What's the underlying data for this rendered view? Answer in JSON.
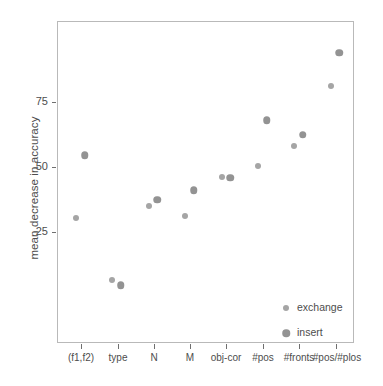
{
  "chart_data": {
    "type": "scatter",
    "title": "",
    "xlabel": "",
    "ylabel": "mean decrease in accuracy",
    "categories": [
      "(f1,f2)",
      "type",
      "N",
      "M",
      "obj-cor",
      "#pos",
      "#fronts",
      "#pos/#plos"
    ],
    "yticks": [
      25,
      50,
      75
    ],
    "ylim": [
      0,
      100
    ],
    "grid": false,
    "legend_position": "bottom-right",
    "series": [
      {
        "name": "exchange",
        "color": "#a5a5a5",
        "marker_size": "small",
        "values": [
          30.3,
          6.5,
          35.0,
          31.0,
          46.0,
          50.5,
          58.0,
          81.0
        ]
      },
      {
        "name": "insert",
        "color": "#939393",
        "marker_size": "large",
        "values": [
          54.5,
          4.5,
          37.5,
          41.0,
          45.8,
          68.0,
          62.5,
          94.0
        ]
      }
    ]
  },
  "axes": {
    "y_tick_labels": [
      "75",
      "50",
      "25"
    ],
    "y_title": "mean decrease in accuracy",
    "x_tick_labels": [
      "(f1,f2)",
      "type",
      "N",
      "M",
      "obj-cor",
      "#pos",
      "#fronts",
      "#pos/#plos"
    ]
  },
  "legend": {
    "entries": [
      {
        "label": "exchange",
        "key": "exchange-marker"
      },
      {
        "label": "insert",
        "key": "insert-marker"
      }
    ]
  }
}
